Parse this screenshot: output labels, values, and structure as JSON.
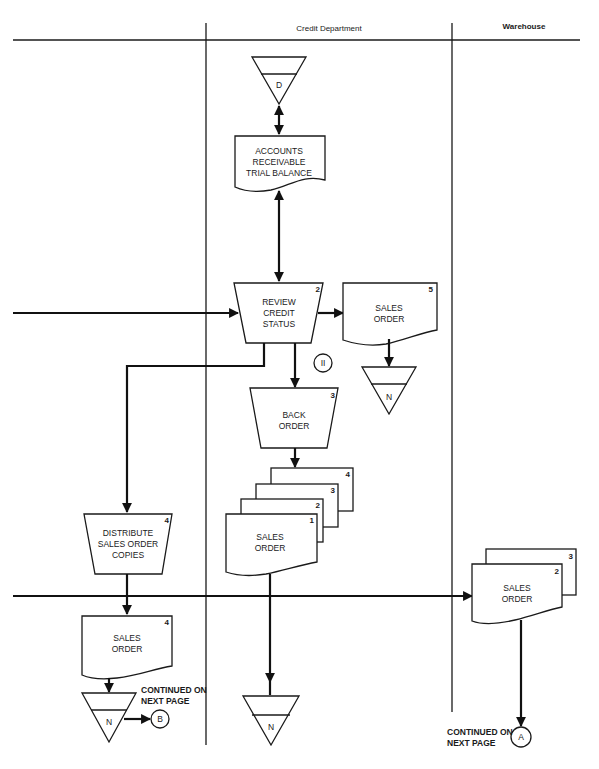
{
  "lanes": {
    "credit": "Credit Department",
    "warehouse": "Warehouse"
  },
  "colors": {
    "ink": "#1a1a1a",
    "paper": "#ffffff"
  },
  "nodes": {
    "file_d": {
      "type": "offline-storage",
      "label": "D"
    },
    "ar_trial": {
      "type": "document",
      "line1": "ACCOUNTS",
      "line2": "RECEIVABLE",
      "line3": "TRIAL BALANCE"
    },
    "review": {
      "type": "manual-operation",
      "num": "2",
      "line1": "REVIEW",
      "line2": "CREDIT",
      "line3": "STATUS"
    },
    "so5": {
      "type": "document",
      "num": "5",
      "line1": "SALES",
      "line2": "ORDER"
    },
    "file_n1": {
      "type": "offline-storage",
      "label": "N"
    },
    "annotation": {
      "type": "connector",
      "label": "II"
    },
    "back_order": {
      "type": "manual-operation",
      "num": "3",
      "line1": "BACK",
      "line2": "ORDER"
    },
    "so_stack": {
      "type": "multi-document",
      "nums": [
        "1",
        "2",
        "3",
        "4"
      ],
      "line1": "SALES",
      "line2": "ORDER"
    },
    "distribute": {
      "type": "manual-operation",
      "num": "4",
      "line1": "DISTRIBUTE",
      "line2": "SALES ORDER",
      "line3": "COPIES"
    },
    "so4": {
      "type": "document",
      "num": "4",
      "line1": "SALES",
      "line2": "ORDER"
    },
    "file_n2": {
      "type": "offline-storage",
      "label": "N"
    },
    "conn_b": {
      "type": "off-page-connector",
      "label": "B"
    },
    "note_b": {
      "line1": "CONTINUED ON",
      "line2": "NEXT PAGE"
    },
    "file_n3": {
      "type": "offline-storage",
      "label": "N"
    },
    "wh_stack": {
      "type": "multi-document",
      "nums": [
        "2",
        "3"
      ],
      "line1": "SALES",
      "line2": "ORDER"
    },
    "conn_a": {
      "type": "off-page-connector",
      "label": "A"
    },
    "note_a": {
      "line1": "CONTINUED ON",
      "line2": "NEXT PAGE"
    }
  }
}
